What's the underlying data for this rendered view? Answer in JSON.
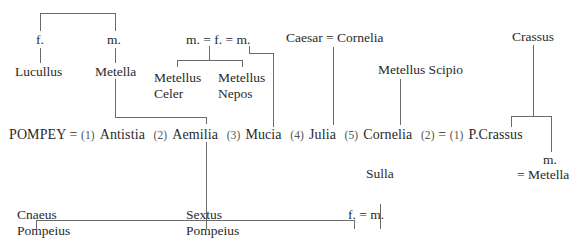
{
  "diagram": {
    "type": "family-tree",
    "top_left": {
      "father": "f.",
      "mother": "m.",
      "son": "Lucullus",
      "daughter": "Metella"
    },
    "metelli": {
      "couple": "m. = f. = m.",
      "child1_line1": "Metellus",
      "child1_line2": "Celer",
      "child2_line1": "Metellus",
      "child2_line2": "Nepos"
    },
    "caesar_couple": "Caesar = Cornelia",
    "metellus_scipio": "Metellus Scipio",
    "crassus": "Crassus",
    "main_row": {
      "pompey": "POMPEY",
      "eq": "=",
      "wives": [
        {
          "num": "(1)",
          "name": "Antistia"
        },
        {
          "num": "(2)",
          "name": "Aemilia"
        },
        {
          "num": "(3)",
          "name": "Mucia"
        },
        {
          "num": "(4)",
          "name": "Julia"
        },
        {
          "num": "(5)",
          "name": "Cornelia"
        }
      ],
      "cornelia_second": "(2)",
      "eq2": "=",
      "pcrassus_first": "(1)",
      "pcrassus": "P.Crassus"
    },
    "crassus_other_child": {
      "label": "m.",
      "spouse": "= Metella"
    },
    "sulla": "Sulla",
    "children": [
      {
        "line1": "Cnaeus",
        "line2": "Pompeius"
      },
      {
        "line1": "Sextus",
        "line2": "Pompeius"
      }
    ],
    "daughter_couple": "f. = m."
  }
}
